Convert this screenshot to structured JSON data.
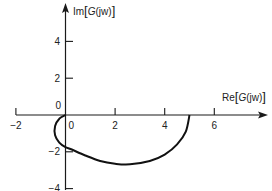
{
  "chart_data": {
    "type": "line",
    "title": "",
    "xlabel": "Re[G(jw)]",
    "ylabel": "Im[G(jw)]",
    "xlabel_parts": {
      "prefix": "Re",
      "open": "[",
      "func": "G",
      "arg": "(jw)",
      "close": "]"
    },
    "ylabel_parts": {
      "prefix": "Im",
      "open": "[",
      "func": "G",
      "arg": "(jw)",
      "close": "]"
    },
    "xlim": [
      -2,
      8
    ],
    "ylim": [
      -4,
      6
    ],
    "x_ticks": [
      -2,
      0,
      2,
      4,
      6
    ],
    "y_ticks": [
      -4,
      -2,
      0,
      2,
      4
    ],
    "x_tick_labels": [
      "−2",
      "0",
      "2",
      "4",
      "6"
    ],
    "y_tick_labels": [
      "−4",
      "−2",
      "0",
      "2",
      "4"
    ],
    "grid": false,
    "legend": null,
    "series": [
      {
        "name": "Nyquist locus G(jw)",
        "points": [
          [
            5.0,
            0.0
          ],
          [
            4.85,
            -0.9
          ],
          [
            4.5,
            -1.6
          ],
          [
            4.0,
            -2.15
          ],
          [
            3.4,
            -2.5
          ],
          [
            2.6,
            -2.68
          ],
          [
            2.0,
            -2.65
          ],
          [
            1.4,
            -2.5
          ],
          [
            0.8,
            -2.2
          ],
          [
            0.2,
            -1.85
          ],
          [
            0.0,
            -1.75
          ],
          [
            -0.25,
            -1.5
          ],
          [
            -0.42,
            -1.1
          ],
          [
            -0.42,
            -0.6
          ],
          [
            -0.25,
            -0.2
          ],
          [
            0.0,
            0.0
          ]
        ]
      }
    ]
  },
  "labels": {
    "origin_y": "0",
    "origin_x": "0"
  }
}
